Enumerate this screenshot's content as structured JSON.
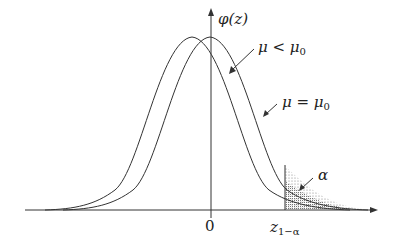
{
  "figure": {
    "type": "normal-density-power-diagram",
    "y_axis_label": "φ(z)",
    "x_tick_zero": "0",
    "critical_value_label": "z",
    "critical_value_subscript": "1−α",
    "curve_labels": {
      "shifted": "μ < μ",
      "shifted_sub": "0",
      "null": "μ = μ",
      "null_sub": "0"
    },
    "area_label": "α",
    "colors": {
      "line": "#333333",
      "background": "#ffffff",
      "shade": "#666666"
    }
  }
}
